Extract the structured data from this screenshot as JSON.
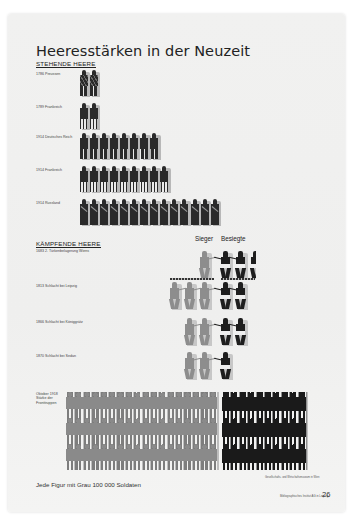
{
  "title": "Heeresstärken in der Neuzeit",
  "sections": {
    "standing": {
      "heading": "STEHENDE HEERE"
    },
    "fighting": {
      "heading": "KÄMPFENDE HEERE",
      "legend_victor": "Sieger",
      "legend_defeated": "Besiegte"
    }
  },
  "standing_rows": [
    {
      "label": "1786 Preussen",
      "figures": 2,
      "style": "pr"
    },
    {
      "label": "1789 Frankreich",
      "figures": 2,
      "style": "fr"
    },
    {
      "label": "1914 Deutsches Reich",
      "figures": 8,
      "style": "de"
    },
    {
      "label": "1914 Frankreich",
      "figures": 9,
      "style": "fr"
    },
    {
      "label": "1914 Russland",
      "figures": 14,
      "style": "ru"
    }
  ],
  "battles": [
    {
      "label": "1683 2. Türkenbelagerung Wiens",
      "victors": 1,
      "defeated": 2.5
    },
    {
      "label": "1813 Schlacht bei Leipzig",
      "victors": 3,
      "defeated": 2
    },
    {
      "label": "1866 Schlacht bei Königgrätz",
      "victors": 2,
      "defeated": 2
    },
    {
      "label": "1870 Schlacht bei Sedan",
      "victors": 2,
      "defeated": 1
    }
  ],
  "ww1": {
    "label": "Oktober 1918 Stärke der Fronttruppen",
    "victors_per_row": 18,
    "victors_rows": 3,
    "defeated_per_row": 10,
    "defeated_rows": 3
  },
  "caption": "Jede Figur mit Grau 100 000 Soldaten",
  "footnote": "Gesellschafts- und Wirtschaftsmuseum in Wien",
  "credit": "Bibliographisches Institut AG in Leipzig",
  "page_number": "26",
  "chart_data": {
    "type": "isotype pictogram chart",
    "title": "Heeresstärken in der Neuzeit",
    "unit": "1 Figur = 100 000 Soldaten",
    "series": [
      {
        "name": "Stehende Heere",
        "categories": [
          "1786 Preussen",
          "1789 Frankreich",
          "1914 Deutsches Reich",
          "1914 Frankreich",
          "1914 Russland"
        ],
        "values_figures": [
          2,
          2,
          8,
          9,
          14
        ],
        "values_soldiers": [
          200000,
          200000,
          800000,
          900000,
          1400000
        ]
      },
      {
        "name": "Kämpfende Heere – Sieger",
        "categories": [
          "1683 Wien",
          "1813 Leipzig",
          "1866 Königgrätz",
          "1870 Sedan",
          "Oktober 1918 Fronttruppen"
        ],
        "values_figures": [
          1,
          3,
          2,
          2,
          54
        ]
      },
      {
        "name": "Kämpfende Heere – Besiegte",
        "categories": [
          "1683 Wien",
          "1813 Leipzig",
          "1866 Königgrätz",
          "1870 Sedan",
          "Oktober 1918 Fronttruppen"
        ],
        "values_figures": [
          2.5,
          2,
          2,
          1,
          30
        ]
      }
    ],
    "legend": [
      "Sieger (grau)",
      "Besiegte (schwarz)"
    ],
    "colors": {
      "victor": "#8d8d8d",
      "defeated": "#1e1e1e",
      "shadow": "#c0c0c0"
    }
  }
}
